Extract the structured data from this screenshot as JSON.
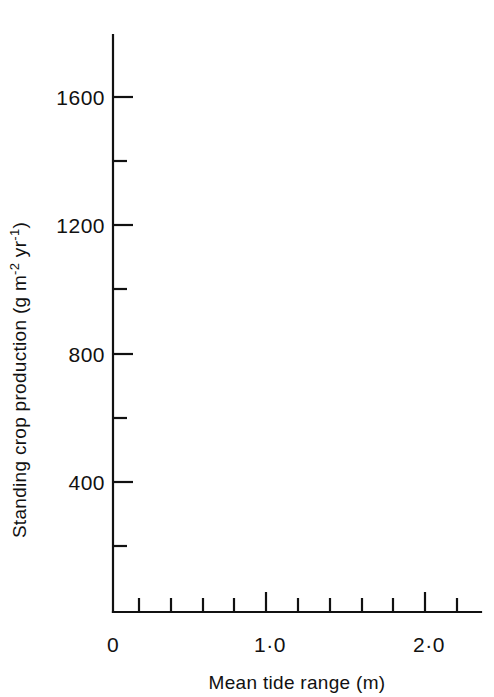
{
  "chart_data": {
    "type": "scatter",
    "title": "",
    "xlabel": "Mean tide range (m)",
    "ylabel": "Standing crop production (g m⁻² yr⁻¹)",
    "ylabel_parts": {
      "prefix": "Standing crop production (g m",
      "sup1": "-2",
      "mid": " yr",
      "sup2": "-1",
      "suffix": ")"
    },
    "xlim": [
      0,
      2.43
    ],
    "ylim": [
      0,
      1800
    ],
    "grid": false,
    "legend": "inline-annotations",
    "x_ticks_major": [
      {
        "value": 0,
        "label": "0"
      },
      {
        "value": 1.0,
        "label": "1·0"
      },
      {
        "value": 2.0,
        "label": "2·0"
      }
    ],
    "x_ticks_minor": [
      0.2,
      0.4,
      0.6,
      0.8,
      1.2,
      1.4,
      1.6,
      1.8,
      2.2,
      2.4
    ],
    "y_ticks_major": [
      {
        "value": 400,
        "label": "400"
      },
      {
        "value": 800,
        "label": "800"
      },
      {
        "value": 1200,
        "label": "1200"
      },
      {
        "value": 1600,
        "label": "1600"
      }
    ],
    "y_ticks_minor": [
      200,
      600,
      1000,
      1400,
      1800
    ],
    "series": [
      {
        "name": "1973",
        "marker": "circle",
        "annotation_label": "1973",
        "annotation_x": 0.44,
        "annotation_y": 1060,
        "points": [
          {
            "x": 0.68,
            "y": 1010
          },
          {
            "x": 0.86,
            "y": 1480
          },
          {
            "x": 0.97,
            "y": 1222
          },
          {
            "x": 1.44,
            "y": 1360
          },
          {
            "x": 1.48,
            "y": 1440
          },
          {
            "x": 1.74,
            "y": 1480
          },
          {
            "x": 2.04,
            "y": 1555
          },
          {
            "x": 2.19,
            "y": 1630
          }
        ],
        "trend_line": {
          "x1": 0.54,
          "y1": 960,
          "x2": 2.27,
          "y2": 1700
        }
      },
      {
        "name": "1971",
        "marker": "triangle",
        "annotation_label": "1971",
        "annotation_x": 0.46,
        "annotation_y": 700,
        "points": [
          {
            "x": 0.72,
            "y": 605
          },
          {
            "x": 0.83,
            "y": 635
          },
          {
            "x": 1.01,
            "y": 930
          },
          {
            "x": 1.33,
            "y": 880
          },
          {
            "x": 1.36,
            "y": 905
          },
          {
            "x": 1.42,
            "y": 975
          },
          {
            "x": 1.46,
            "y": 990
          },
          {
            "x": 1.64,
            "y": 1065
          },
          {
            "x": 1.81,
            "y": 1135
          },
          {
            "x": 2.06,
            "y": 1140
          },
          {
            "x": 2.15,
            "y": 1290
          },
          {
            "x": 2.33,
            "y": 1520
          },
          {
            "x": 2.33,
            "y": 1420
          }
        ],
        "trend_line": {
          "x1": 0.62,
          "y1": 495,
          "x2": 2.22,
          "y2": 1330
        }
      },
      {
        "name": "other-observations",
        "marker": "cross",
        "annotation_label": "",
        "points": [
          {
            "x": 0.82,
            "y": 450
          },
          {
            "x": 0.87,
            "y": 840
          },
          {
            "x": 1.0,
            "y": 430
          },
          {
            "x": 1.04,
            "y": 820
          },
          {
            "x": 1.24,
            "y": 1400
          },
          {
            "x": 1.27,
            "y": 1140
          },
          {
            "x": 1.37,
            "y": 825
          },
          {
            "x": 1.4,
            "y": 1140
          },
          {
            "x": 1.41,
            "y": 960
          },
          {
            "x": 1.47,
            "y": 890
          },
          {
            "x": 1.52,
            "y": 610
          },
          {
            "x": 2.1,
            "y": 1620
          },
          {
            "x": 2.15,
            "y": 1740
          }
        ]
      }
    ]
  }
}
